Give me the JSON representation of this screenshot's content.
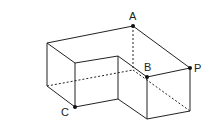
{
  "diagram": {
    "type": "3d-solid",
    "labels": {
      "A": "A",
      "B": "B",
      "C": "C",
      "P": "P"
    },
    "line_color": "#222222",
    "point_color": "#111111"
  }
}
